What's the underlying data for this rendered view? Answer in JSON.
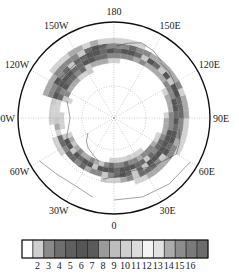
{
  "map": {
    "projection": "north-polar-stereographic",
    "center": [
      114,
      118
    ],
    "radius": 96,
    "lon_labels": [
      {
        "text": "180",
        "lon": 180
      },
      {
        "text": "150E",
        "lon": 150
      },
      {
        "text": "120E",
        "lon": 120
      },
      {
        "text": "90E",
        "lon": 90
      },
      {
        "text": "60E",
        "lon": 60
      },
      {
        "text": "30E",
        "lon": 30
      },
      {
        "text": "0",
        "lon": 0
      },
      {
        "text": "30W",
        "lon": -30
      },
      {
        "text": "60W",
        "lon": -60
      },
      {
        "text": "90W",
        "lon": -90
      },
      {
        "text": "120W",
        "lon": -120
      },
      {
        "text": "150W",
        "lon": -150
      }
    ],
    "lat_circles_radii": [
      32,
      64
    ],
    "band": {
      "description": "annular storm-track band of shaded values around the pole",
      "inner_radius": 40,
      "outer_radius": 76
    }
  },
  "colorbar": {
    "labels": [
      "2",
      "3",
      "4",
      "5",
      "6",
      "7",
      "8",
      "9",
      "10",
      "11",
      "12",
      "13",
      "14",
      "15",
      "16"
    ],
    "colors": [
      "#ffffff",
      "#cfcfcf",
      "#8a8a8a",
      "#6e6e6e",
      "#5f5f5f",
      "#555555",
      "#5a5a5a",
      "#9a9a9a",
      "#bdbdbd",
      "#d0d0d0",
      "#dcdcdc",
      "#f4f4f4",
      "#e2e2e2",
      "#ababab",
      "#8c8c8c",
      "#7a7a7a",
      "#6c6c6c"
    ]
  }
}
